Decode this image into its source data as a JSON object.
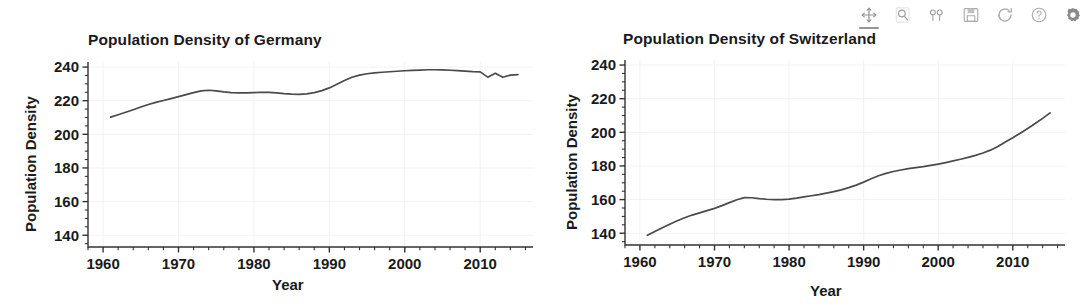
{
  "toolbar": {
    "buttons": [
      {
        "name": "pan-icon",
        "label": "Pan/Zoom",
        "active": true
      },
      {
        "name": "magnifier-icon",
        "label": "Zoom to rectangle",
        "active": false
      },
      {
        "name": "subplot-config-icon",
        "label": "Configure subplots",
        "active": false
      },
      {
        "name": "save-icon",
        "label": "Save figure",
        "active": false
      },
      {
        "name": "refresh-icon",
        "label": "Reset view",
        "active": false
      },
      {
        "name": "help-icon",
        "label": "Help",
        "active": false
      },
      {
        "name": "gear-icon",
        "label": "Settings",
        "active": false
      }
    ]
  },
  "chart_data": [
    {
      "type": "line",
      "title": "Population Density of Germany",
      "xlabel": "Year",
      "ylabel": "Population Density",
      "xlim": [
        1958,
        2017
      ],
      "ylim": [
        133,
        243
      ],
      "xticks": [
        1960,
        1970,
        1980,
        1990,
        2000,
        2010
      ],
      "yticks": [
        140,
        160,
        180,
        200,
        220,
        240
      ],
      "xtick_labels": [
        "1960",
        "1970",
        "1980",
        "1990",
        "2000",
        "2010"
      ],
      "ytick_labels": [
        "140",
        "160",
        "180",
        "200",
        "220",
        "240"
      ],
      "minor_tick_step_x": 2,
      "minor_tick_step_y": 5,
      "grid": true,
      "legend": null,
      "line_color": "#4a4a4a",
      "x": [
        1961,
        1962,
        1963,
        1964,
        1965,
        1966,
        1967,
        1968,
        1969,
        1970,
        1971,
        1972,
        1973,
        1974,
        1975,
        1976,
        1977,
        1978,
        1979,
        1980,
        1981,
        1982,
        1983,
        1984,
        1985,
        1986,
        1987,
        1988,
        1989,
        1990,
        1991,
        1992,
        1993,
        1994,
        1995,
        1996,
        1997,
        1998,
        1999,
        2000,
        2001,
        2002,
        2003,
        2004,
        2005,
        2006,
        2007,
        2008,
        2009,
        2010,
        2011,
        2012,
        2013,
        2014,
        2015
      ],
      "y": [
        210.2,
        211.6,
        213.1,
        214.6,
        216.2,
        217.7,
        219.0,
        220.1,
        221.2,
        222.4,
        223.6,
        224.8,
        225.8,
        226.2,
        225.8,
        225.2,
        224.8,
        224.6,
        224.6,
        224.8,
        225.0,
        224.9,
        224.6,
        224.2,
        223.9,
        223.8,
        224.0,
        224.8,
        226.0,
        227.6,
        229.8,
        232.0,
        233.9,
        235.2,
        236.0,
        236.5,
        236.9,
        237.2,
        237.5,
        237.8,
        238.0,
        238.2,
        238.4,
        238.4,
        238.3,
        238.1,
        237.9,
        237.6,
        237.3,
        237.1,
        234.0,
        236.3,
        233.9,
        235.2,
        235.5
      ]
    },
    {
      "type": "line",
      "title": "Population Density of Switzerland",
      "xlabel": "Year",
      "ylabel": "Population Density",
      "xlim": [
        1958,
        2017
      ],
      "ylim": [
        133,
        243
      ],
      "xticks": [
        1960,
        1970,
        1980,
        1990,
        2000,
        2010
      ],
      "yticks": [
        140,
        160,
        180,
        200,
        220,
        240
      ],
      "xtick_labels": [
        "1960",
        "1970",
        "1980",
        "1990",
        "2000",
        "2010"
      ],
      "ytick_labels": [
        "140",
        "160",
        "180",
        "200",
        "220",
        "240"
      ],
      "minor_tick_step_x": 2,
      "minor_tick_step_y": 5,
      "grid": true,
      "legend": null,
      "line_color": "#4a4a4a",
      "x": [
        1961,
        1962,
        1963,
        1964,
        1965,
        1966,
        1967,
        1968,
        1969,
        1970,
        1971,
        1972,
        1973,
        1974,
        1975,
        1976,
        1977,
        1978,
        1979,
        1980,
        1981,
        1982,
        1983,
        1984,
        1985,
        1986,
        1987,
        1988,
        1989,
        1990,
        1991,
        1992,
        1993,
        1994,
        1995,
        1996,
        1997,
        1998,
        1999,
        2000,
        2001,
        2002,
        2003,
        2004,
        2005,
        2006,
        2007,
        2008,
        2009,
        2010,
        2011,
        2012,
        2013,
        2014,
        2015
      ],
      "y": [
        138.8,
        141.0,
        143.2,
        145.4,
        147.4,
        149.2,
        150.8,
        152.1,
        153.4,
        154.8,
        156.4,
        158.2,
        159.9,
        161.2,
        161.1,
        160.6,
        160.2,
        160.0,
        160.0,
        160.3,
        160.9,
        161.6,
        162.3,
        163.0,
        163.8,
        164.7,
        165.8,
        167.1,
        168.6,
        170.4,
        172.4,
        174.2,
        175.6,
        176.7,
        177.6,
        178.4,
        179.0,
        179.6,
        180.3,
        181.1,
        182.0,
        183.0,
        184.0,
        185.1,
        186.3,
        187.7,
        189.4,
        191.6,
        194.2,
        196.8,
        199.5,
        202.3,
        205.2,
        208.3,
        211.6
      ]
    }
  ]
}
